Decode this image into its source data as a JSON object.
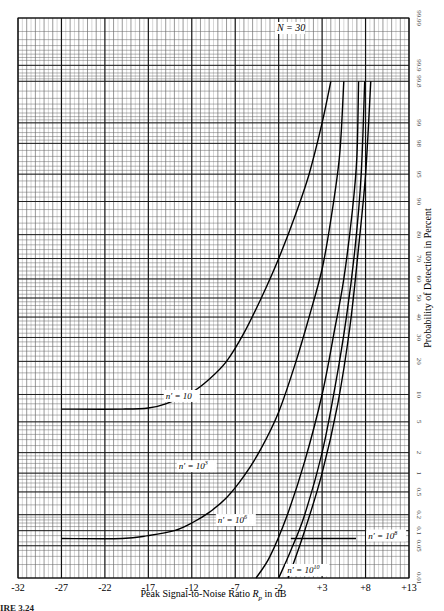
{
  "chart_data": {
    "type": "line",
    "title": "N = 30",
    "xlabel": "Peak Signal-to-Noise Ratio R_p in dB",
    "xlabel_main": "Peak Signal-to-Noise Ratio ",
    "xlabel_var": "R",
    "xlabel_sub": "p",
    "xlabel_unit": " in dB",
    "ylabel": "Probability of Detection in Percent",
    "xlim": [
      -32,
      13
    ],
    "ylim": [
      0.01,
      99.99
    ],
    "yscale": "normal-probability",
    "grid": true,
    "x_ticks": [
      -32,
      -27,
      -22,
      -17,
      -12,
      -7,
      -2,
      3,
      8,
      13
    ],
    "x_tick_labels": [
      "-32",
      "-27",
      "-22",
      "-17",
      "-12",
      "-7",
      "-2",
      "+3",
      "+8",
      "+13"
    ],
    "y_ticks": [
      0.01,
      0.05,
      0.1,
      0.2,
      0.5,
      1,
      2,
      5,
      10,
      20,
      30,
      40,
      50,
      60,
      70,
      80,
      90,
      95,
      98,
      99,
      99.8,
      99.9,
      99.99
    ],
    "y_tick_labels": [
      "0.01",
      "0.05",
      "0.1",
      "0.2",
      "0.5",
      "1",
      "2",
      "5",
      "10",
      "20",
      "30",
      "40",
      "50",
      "60",
      "70",
      "80",
      "90",
      "95",
      "98",
      "99",
      "99.8",
      "99.9",
      "99.99"
    ],
    "series": [
      {
        "name": "n' = 10",
        "label_text": "n′ = 10",
        "label_sup": "",
        "label_pos": [
          -15.0,
          9.0
        ],
        "points": [
          [
            -27,
            7.0
          ],
          [
            -20,
            7.0
          ],
          [
            -17,
            7.2
          ],
          [
            -15,
            8.0
          ],
          [
            -12,
            10.5
          ],
          [
            -10,
            14
          ],
          [
            -8,
            20
          ],
          [
            -6,
            32
          ],
          [
            -4,
            50
          ],
          [
            -2,
            70
          ],
          [
            0,
            87
          ],
          [
            1.5,
            95
          ],
          [
            3,
            99
          ],
          [
            4,
            99.8
          ]
        ]
      },
      {
        "name": "n' = 10^3",
        "label_text": "n′ = 10",
        "label_sup": "3",
        "label_pos": [
          -13.5,
          1.15
        ],
        "points": [
          [
            -27,
            0.07
          ],
          [
            -20,
            0.07
          ],
          [
            -17,
            0.08
          ],
          [
            -14,
            0.1
          ],
          [
            -12,
            0.14
          ],
          [
            -10,
            0.22
          ],
          [
            -8,
            0.4
          ],
          [
            -6,
            0.9
          ],
          [
            -4,
            2.3
          ],
          [
            -2,
            6.5
          ],
          [
            0,
            20
          ],
          [
            1.5,
            40
          ],
          [
            3,
            65
          ],
          [
            4,
            85
          ],
          [
            5,
            97
          ],
          [
            5.5,
            99.8
          ]
        ]
      },
      {
        "name": "n' = 10^6",
        "label_text": "n′ = 10",
        "label_sup": "6",
        "label_pos": [
          -9.0,
          0.14
        ],
        "points": [
          [
            -4.6,
            0.01
          ],
          [
            -3,
            0.03
          ],
          [
            -1,
            0.2
          ],
          [
            1,
            1.5
          ],
          [
            3,
            10
          ],
          [
            4.5,
            35
          ],
          [
            5.5,
            60
          ],
          [
            6.5,
            88
          ],
          [
            7.0,
            97
          ],
          [
            7.2,
            99.8
          ]
        ]
      },
      {
        "name": "n' = 10^8",
        "label_text": "n′ = 10",
        "label_sup": "8",
        "label_pos": [
          8.3,
          0.07
        ],
        "leader": [
          [
            -0.6,
            0.07
          ],
          [
            6.9,
            0.07
          ]
        ],
        "points": [
          [
            -2.0,
            0.01
          ],
          [
            -0.6,
            0.04
          ],
          [
            1,
            0.2
          ],
          [
            3,
            2
          ],
          [
            4.5,
            12
          ],
          [
            5.8,
            40
          ],
          [
            6.8,
            75
          ],
          [
            7.5,
            95
          ],
          [
            7.9,
            99.8
          ]
        ]
      },
      {
        "name": "n' = 10^10",
        "label_text": "n′ = 10",
        "label_sup": "10",
        "label_pos": [
          -1.0,
          0.013
        ],
        "points": [
          [
            -0.9,
            0.01
          ],
          [
            1,
            0.1
          ],
          [
            3,
            1.0
          ],
          [
            4.8,
            8
          ],
          [
            6.2,
            35
          ],
          [
            7.2,
            75
          ],
          [
            8.0,
            95
          ],
          [
            8.6,
            99.8
          ]
        ]
      }
    ]
  },
  "caption": "IRE 3.24"
}
